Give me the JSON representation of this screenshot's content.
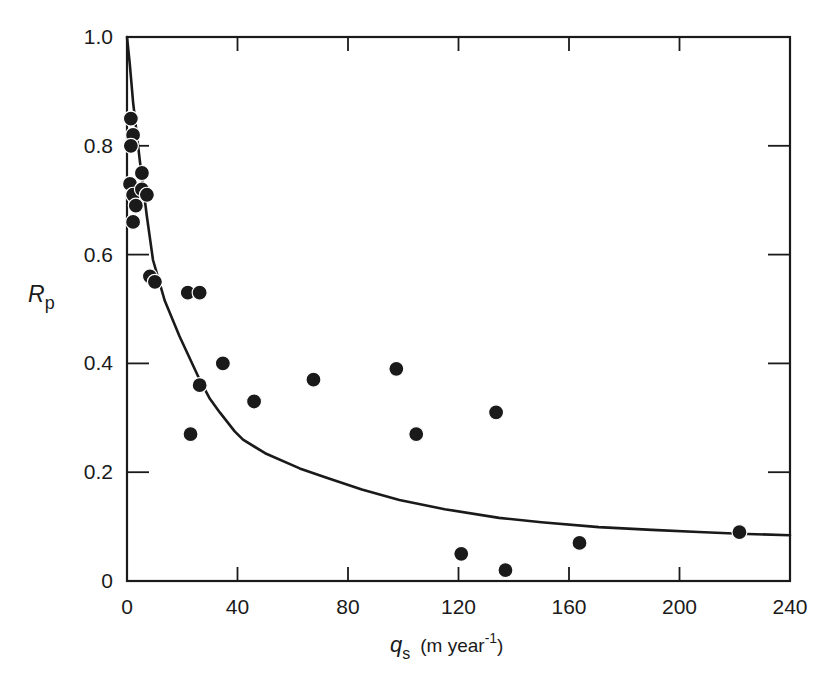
{
  "chart_data": {
    "type": "scatter",
    "title": "",
    "xlabel": "q_s (m year^-1)",
    "xlabel_parts": {
      "var": "q",
      "sub": "s",
      "unit_pre": "(m year",
      "sup": "-1",
      "unit_post": ")"
    },
    "ylabel": "R_p",
    "ylabel_parts": {
      "var": "R",
      "sub": "p"
    },
    "xlim": [
      0,
      240
    ],
    "ylim": [
      0,
      1.0
    ],
    "xticks": [
      0,
      40,
      80,
      120,
      160,
      200,
      240
    ],
    "xtick_labels": [
      "0",
      "40",
      "80",
      "120",
      "160",
      "200",
      "240"
    ],
    "yticks": [
      0,
      0.2,
      0.4,
      0.6,
      0.8,
      1.0
    ],
    "ytick_labels": [
      "0",
      "0.2",
      "0.4",
      "0.6",
      "0.8",
      "1.0"
    ],
    "grid": false,
    "legend": null,
    "box": true,
    "ticks_on_all_sides": true,
    "colors": {
      "axis": "#1a1a1a",
      "marker": "#1a1a1a",
      "line": "#1a1a1a",
      "background": "#ffffff"
    },
    "series": [
      {
        "name": "observations",
        "kind": "scatter",
        "marker": "filled-circle",
        "points": [
          {
            "x": 1.4,
            "y": 0.85
          },
          {
            "x": 2.2,
            "y": 0.82
          },
          {
            "x": 1.4,
            "y": 0.8
          },
          {
            "x": 5.4,
            "y": 0.75
          },
          {
            "x": 1.1,
            "y": 0.73
          },
          {
            "x": 2.2,
            "y": 0.71
          },
          {
            "x": 5.4,
            "y": 0.72
          },
          {
            "x": 7.2,
            "y": 0.71
          },
          {
            "x": 3.2,
            "y": 0.69
          },
          {
            "x": 2.2,
            "y": 0.66
          },
          {
            "x": 8.3,
            "y": 0.56
          },
          {
            "x": 10.1,
            "y": 0.55
          },
          {
            "x": 22.0,
            "y": 0.53
          },
          {
            "x": 26.3,
            "y": 0.53
          },
          {
            "x": 34.7,
            "y": 0.4
          },
          {
            "x": 26.3,
            "y": 0.36
          },
          {
            "x": 23.0,
            "y": 0.27
          },
          {
            "x": 46.0,
            "y": 0.33
          },
          {
            "x": 67.5,
            "y": 0.37
          },
          {
            "x": 97.5,
            "y": 0.39
          },
          {
            "x": 104.7,
            "y": 0.27
          },
          {
            "x": 133.6,
            "y": 0.31
          },
          {
            "x": 121.0,
            "y": 0.05
          },
          {
            "x": 137.0,
            "y": 0.02
          },
          {
            "x": 163.8,
            "y": 0.07
          },
          {
            "x": 221.7,
            "y": 0.09
          }
        ]
      },
      {
        "name": "fitted curve",
        "kind": "line",
        "points": [
          {
            "x": 0,
            "y": 1.0
          },
          {
            "x": 1,
            "y": 0.95
          },
          {
            "x": 2.2,
            "y": 0.88
          },
          {
            "x": 4.7,
            "y": 0.77
          },
          {
            "x": 7.2,
            "y": 0.67
          },
          {
            "x": 9.4,
            "y": 0.59
          },
          {
            "x": 13.7,
            "y": 0.515
          },
          {
            "x": 19,
            "y": 0.45
          },
          {
            "x": 26.3,
            "y": 0.37
          },
          {
            "x": 30,
            "y": 0.335
          },
          {
            "x": 33.6,
            "y": 0.31
          },
          {
            "x": 39,
            "y": 0.275
          },
          {
            "x": 42,
            "y": 0.26
          },
          {
            "x": 50,
            "y": 0.235
          },
          {
            "x": 62.5,
            "y": 0.207
          },
          {
            "x": 72,
            "y": 0.19
          },
          {
            "x": 85,
            "y": 0.168
          },
          {
            "x": 98.6,
            "y": 0.149
          },
          {
            "x": 115,
            "y": 0.132
          },
          {
            "x": 134.7,
            "y": 0.116
          },
          {
            "x": 150,
            "y": 0.108
          },
          {
            "x": 170.8,
            "y": 0.099
          },
          {
            "x": 190,
            "y": 0.094
          },
          {
            "x": 206.9,
            "y": 0.09
          },
          {
            "x": 221.7,
            "y": 0.087
          },
          {
            "x": 240,
            "y": 0.084
          }
        ]
      }
    ]
  },
  "layout": {
    "plot_left_px": 127,
    "plot_right_px": 790,
    "plot_top_px": 37,
    "plot_bottom_px": 581
  }
}
